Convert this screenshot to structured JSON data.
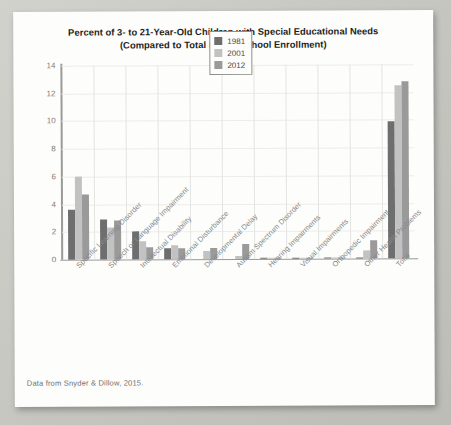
{
  "card": {
    "caption": "Data from Snyder & Dillow, 2015."
  },
  "chart_data": {
    "type": "bar",
    "title": "Percent of 3- to 21-Year-Old Children with Special Educational Needs",
    "subtitle": "(Compared to Total Public School Enrollment)",
    "title_line1": "Percent of 3- to 21-Year-Old Children with Special Educational Needs",
    "title_line2": "(Compared to Total Public School Enrollment)",
    "xlabel": "",
    "ylabel": "",
    "ylim": [
      0,
      14
    ],
    "yticks": [
      0,
      2,
      4,
      6,
      8,
      10,
      12,
      14
    ],
    "ytick_labels": [
      "0",
      "2",
      "4",
      "6",
      "8",
      "10",
      "12",
      "14"
    ],
    "grid": true,
    "legend_position": "top-center",
    "categories": [
      "Specific Learning Disorder",
      "Speech or Language Impairment",
      "Intellectual Disability",
      "Emotional Disturbance",
      "Developmental Delay",
      "Autism Spectrum Disorder",
      "Hearing Impairments",
      "Visual Impairments",
      "Orthopedic Impairment",
      "Other Health Problems",
      "Total"
    ],
    "series": [
      {
        "name": "1981",
        "color": "#6e6e6e",
        "values": [
          3.6,
          2.9,
          2.0,
          0.8,
          0.0,
          0.0,
          0.1,
          0.1,
          0.1,
          0.1,
          9.9
        ]
      },
      {
        "name": "2001",
        "color": "#c2c2c2",
        "values": [
          6.0,
          2.3,
          1.3,
          1.0,
          0.6,
          0.2,
          0.1,
          0.1,
          0.1,
          0.6,
          12.5
        ]
      },
      {
        "name": "2012",
        "color": "#9a9a9a",
        "values": [
          4.7,
          2.8,
          0.9,
          0.8,
          0.8,
          1.1,
          0.1,
          0.1,
          0.1,
          1.3,
          12.8
        ]
      }
    ]
  }
}
